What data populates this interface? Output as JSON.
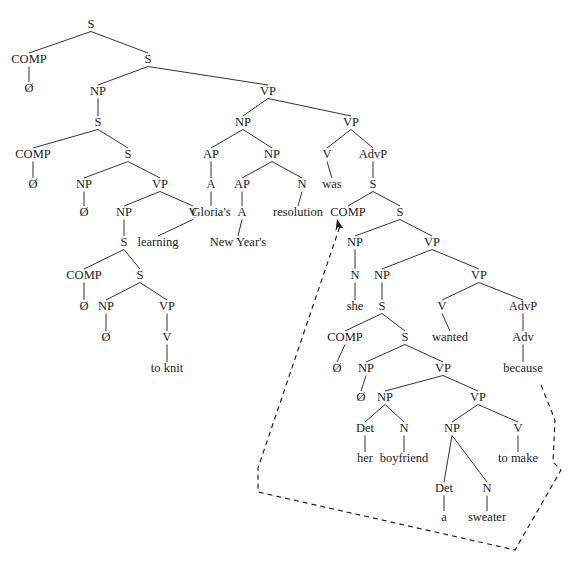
{
  "figure": {
    "type": "syntax-tree",
    "background_color": "#ffffff",
    "line_color": "#1b1b1b",
    "text_color": "#1b1b1b",
    "width": 586,
    "height": 580,
    "sentence": "Ø Ø Ø Ø to knit learning Gloria's New Year's resolution was Ø she Ø Ø her boyfriend a sweater to make because",
    "empty_category_symbol": "Ø"
  },
  "nodes": [
    {
      "id": "n1",
      "label": "S",
      "x": 91,
      "y": 28,
      "kind": "category"
    },
    {
      "id": "n2",
      "label": "COMP",
      "x": 29,
      "y": 63,
      "kind": "category"
    },
    {
      "id": "n3",
      "label": "Ø",
      "x": 29,
      "y": 92,
      "kind": "terminal"
    },
    {
      "id": "n4",
      "label": "S",
      "x": 148,
      "y": 63,
      "kind": "category"
    },
    {
      "id": "n5",
      "label": "NP",
      "x": 98,
      "y": 95,
      "kind": "category"
    },
    {
      "id": "n6",
      "label": "S",
      "x": 98,
      "y": 126,
      "kind": "category"
    },
    {
      "id": "n7",
      "label": "COMP",
      "x": 33,
      "y": 158,
      "kind": "category"
    },
    {
      "id": "n8",
      "label": "Ø",
      "x": 33,
      "y": 188,
      "kind": "terminal"
    },
    {
      "id": "n9",
      "label": "S",
      "x": 128,
      "y": 158,
      "kind": "category"
    },
    {
      "id": "n10",
      "label": "NP",
      "x": 84,
      "y": 188,
      "kind": "category"
    },
    {
      "id": "n11",
      "label": "Ø",
      "x": 84,
      "y": 216,
      "kind": "terminal"
    },
    {
      "id": "n12",
      "label": "VP",
      "x": 160,
      "y": 188,
      "kind": "category"
    },
    {
      "id": "n13",
      "label": "NP",
      "x": 124,
      "y": 216,
      "kind": "category"
    },
    {
      "id": "n14",
      "label": "S",
      "x": 124,
      "y": 246,
      "kind": "category"
    },
    {
      "id": "n15",
      "label": "COMP",
      "x": 84,
      "y": 279,
      "kind": "category"
    },
    {
      "id": "n16",
      "label": "Ø",
      "x": 84,
      "y": 310,
      "kind": "terminal"
    },
    {
      "id": "n17",
      "label": "S",
      "x": 140,
      "y": 279,
      "kind": "category"
    },
    {
      "id": "n18",
      "label": "NP",
      "x": 106,
      "y": 310,
      "kind": "category"
    },
    {
      "id": "n19",
      "label": "Ø",
      "x": 106,
      "y": 341,
      "kind": "terminal"
    },
    {
      "id": "n20",
      "label": "VP",
      "x": 167,
      "y": 310,
      "kind": "category"
    },
    {
      "id": "n21",
      "label": "V",
      "x": 167,
      "y": 341,
      "kind": "category"
    },
    {
      "id": "n22",
      "label": "to knit",
      "x": 167,
      "y": 372,
      "kind": "terminal"
    },
    {
      "id": "n23",
      "label": "V",
      "x": 193,
      "y": 216,
      "kind": "category"
    },
    {
      "id": "n24",
      "label": "learning",
      "x": 158,
      "y": 246,
      "kind": "terminal"
    },
    {
      "id": "n25",
      "label": "VP",
      "x": 268,
      "y": 95,
      "kind": "category"
    },
    {
      "id": "n26",
      "label": "NP",
      "x": 243,
      "y": 126,
      "kind": "category"
    },
    {
      "id": "n27",
      "label": "AP",
      "x": 211,
      "y": 158,
      "kind": "category"
    },
    {
      "id": "n28",
      "label": "A",
      "x": 211,
      "y": 188,
      "kind": "category"
    },
    {
      "id": "n29",
      "label": "Gloria's",
      "x": 211,
      "y": 216,
      "kind": "terminal"
    },
    {
      "id": "n30",
      "label": "NP",
      "x": 272,
      "y": 158,
      "kind": "category"
    },
    {
      "id": "n31",
      "label": "AP",
      "x": 242,
      "y": 188,
      "kind": "category"
    },
    {
      "id": "n32",
      "label": "A",
      "x": 242,
      "y": 216,
      "kind": "category"
    },
    {
      "id": "n33",
      "label": "New Year's",
      "x": 238,
      "y": 246,
      "kind": "terminal"
    },
    {
      "id": "n34",
      "label": "N",
      "x": 302,
      "y": 188,
      "kind": "category"
    },
    {
      "id": "n35",
      "label": "resolution",
      "x": 298,
      "y": 216,
      "kind": "terminal"
    },
    {
      "id": "n36",
      "label": "VP",
      "x": 351,
      "y": 126,
      "kind": "category"
    },
    {
      "id": "n37",
      "label": "V",
      "x": 327,
      "y": 158,
      "kind": "category"
    },
    {
      "id": "n38",
      "label": "was",
      "x": 332,
      "y": 188,
      "kind": "terminal"
    },
    {
      "id": "n39",
      "label": "AdvP",
      "x": 373,
      "y": 158,
      "kind": "category"
    },
    {
      "id": "n40",
      "label": "S",
      "x": 373,
      "y": 188,
      "kind": "category"
    },
    {
      "id": "n41",
      "label": "COMP",
      "x": 348,
      "y": 216,
      "kind": "category"
    },
    {
      "id": "n42",
      "label": "S",
      "x": 400,
      "y": 216,
      "kind": "category"
    },
    {
      "id": "n43",
      "label": "NP",
      "x": 355,
      "y": 246,
      "kind": "category"
    },
    {
      "id": "n44",
      "label": "N",
      "x": 355,
      "y": 279,
      "kind": "category"
    },
    {
      "id": "n45",
      "label": "she",
      "x": 355,
      "y": 310,
      "kind": "terminal"
    },
    {
      "id": "n46",
      "label": "VP",
      "x": 432,
      "y": 246,
      "kind": "category"
    },
    {
      "id": "n47",
      "label": "NP",
      "x": 382,
      "y": 279,
      "kind": "category"
    },
    {
      "id": "n48",
      "label": "S",
      "x": 382,
      "y": 310,
      "kind": "category"
    },
    {
      "id": "n49",
      "label": "COMP",
      "x": 345,
      "y": 341,
      "kind": "category"
    },
    {
      "id": "n50",
      "label": "Ø",
      "x": 337,
      "y": 372,
      "kind": "terminal"
    },
    {
      "id": "n51",
      "label": "S",
      "x": 405,
      "y": 341,
      "kind": "category"
    },
    {
      "id": "n52",
      "label": "NP",
      "x": 366,
      "y": 372,
      "kind": "category"
    },
    {
      "id": "n53",
      "label": "Ø",
      "x": 361,
      "y": 401,
      "kind": "terminal"
    },
    {
      "id": "n54",
      "label": "VP",
      "x": 443,
      "y": 372,
      "kind": "category"
    },
    {
      "id": "n55",
      "label": "NP",
      "x": 385,
      "y": 401,
      "kind": "category"
    },
    {
      "id": "n56",
      "label": "Det",
      "x": 365,
      "y": 432,
      "kind": "category"
    },
    {
      "id": "n57",
      "label": "her",
      "x": 365,
      "y": 462,
      "kind": "terminal"
    },
    {
      "id": "n58",
      "label": "N",
      "x": 404,
      "y": 432,
      "kind": "category"
    },
    {
      "id": "n59",
      "label": "boyfriend",
      "x": 404,
      "y": 462,
      "kind": "terminal"
    },
    {
      "id": "n60",
      "label": "VP",
      "x": 478,
      "y": 401,
      "kind": "category"
    },
    {
      "id": "n61",
      "label": "NP",
      "x": 452,
      "y": 432,
      "kind": "category"
    },
    {
      "id": "n62",
      "label": "Det",
      "x": 444,
      "y": 492,
      "kind": "category"
    },
    {
      "id": "n63",
      "label": "a",
      "x": 444,
      "y": 521,
      "kind": "terminal"
    },
    {
      "id": "n64",
      "label": "N",
      "x": 487,
      "y": 492,
      "kind": "category"
    },
    {
      "id": "n65",
      "label": "sweater",
      "x": 487,
      "y": 521,
      "kind": "terminal"
    },
    {
      "id": "n66",
      "label": "V",
      "x": 518,
      "y": 432,
      "kind": "category"
    },
    {
      "id": "n67",
      "label": "to make",
      "x": 518,
      "y": 462,
      "kind": "terminal"
    },
    {
      "id": "n68",
      "label": "VP",
      "x": 479,
      "y": 279,
      "kind": "category"
    },
    {
      "id": "n69",
      "label": "V",
      "x": 442,
      "y": 310,
      "kind": "category"
    },
    {
      "id": "n70",
      "label": "wanted",
      "x": 450,
      "y": 341,
      "kind": "terminal"
    },
    {
      "id": "n71",
      "label": "AdvP",
      "x": 523,
      "y": 310,
      "kind": "category"
    },
    {
      "id": "n72",
      "label": "Adv",
      "x": 523,
      "y": 341,
      "kind": "category"
    },
    {
      "id": "n73",
      "label": "because",
      "x": 523,
      "y": 372,
      "kind": "terminal"
    }
  ],
  "edges": [
    [
      "n1",
      "n2"
    ],
    [
      "n1",
      "n4"
    ],
    [
      "n2",
      "n3"
    ],
    [
      "n4",
      "n5"
    ],
    [
      "n4",
      "n25"
    ],
    [
      "n5",
      "n6"
    ],
    [
      "n6",
      "n7"
    ],
    [
      "n6",
      "n9"
    ],
    [
      "n7",
      "n8"
    ],
    [
      "n9",
      "n10"
    ],
    [
      "n9",
      "n12"
    ],
    [
      "n10",
      "n11"
    ],
    [
      "n12",
      "n13"
    ],
    [
      "n12",
      "n23"
    ],
    [
      "n13",
      "n14"
    ],
    [
      "n23",
      "n24"
    ],
    [
      "n14",
      "n15"
    ],
    [
      "n14",
      "n17"
    ],
    [
      "n15",
      "n16"
    ],
    [
      "n17",
      "n18"
    ],
    [
      "n17",
      "n20"
    ],
    [
      "n18",
      "n19"
    ],
    [
      "n20",
      "n21"
    ],
    [
      "n21",
      "n22"
    ],
    [
      "n25",
      "n26"
    ],
    [
      "n25",
      "n36"
    ],
    [
      "n26",
      "n27"
    ],
    [
      "n26",
      "n30"
    ],
    [
      "n27",
      "n28"
    ],
    [
      "n28",
      "n29"
    ],
    [
      "n30",
      "n31"
    ],
    [
      "n30",
      "n34"
    ],
    [
      "n31",
      "n32"
    ],
    [
      "n32",
      "n33"
    ],
    [
      "n34",
      "n35"
    ],
    [
      "n36",
      "n37"
    ],
    [
      "n36",
      "n39"
    ],
    [
      "n37",
      "n38"
    ],
    [
      "n39",
      "n40"
    ],
    [
      "n40",
      "n41"
    ],
    [
      "n40",
      "n42"
    ],
    [
      "n42",
      "n43"
    ],
    [
      "n42",
      "n46"
    ],
    [
      "n43",
      "n44"
    ],
    [
      "n44",
      "n45"
    ],
    [
      "n46",
      "n47"
    ],
    [
      "n46",
      "n68"
    ],
    [
      "n47",
      "n48"
    ],
    [
      "n48",
      "n49"
    ],
    [
      "n48",
      "n51"
    ],
    [
      "n49",
      "n50"
    ],
    [
      "n51",
      "n52"
    ],
    [
      "n51",
      "n54"
    ],
    [
      "n52",
      "n53"
    ],
    [
      "n54",
      "n55"
    ],
    [
      "n54",
      "n60"
    ],
    [
      "n55",
      "n56"
    ],
    [
      "n55",
      "n58"
    ],
    [
      "n56",
      "n57"
    ],
    [
      "n58",
      "n59"
    ],
    [
      "n60",
      "n61"
    ],
    [
      "n60",
      "n66"
    ],
    [
      "n61",
      "n62"
    ],
    [
      "n61",
      "n64"
    ],
    [
      "n62",
      "n63"
    ],
    [
      "n64",
      "n65"
    ],
    [
      "n66",
      "n67"
    ],
    [
      "n68",
      "n69"
    ],
    [
      "n68",
      "n71"
    ],
    [
      "n69",
      "n70"
    ],
    [
      "n71",
      "n72"
    ],
    [
      "n72",
      "n73"
    ]
  ],
  "movement": {
    "name": "extraposition-arrow",
    "style": "dashed",
    "description": "Dashed line from the because-clause up to COMP",
    "points": "541,385 555,420 553,462 561,470 515,550 258,492 258,468 340,226",
    "arrow_tip": {
      "x": 337,
      "y": 219
    }
  }
}
